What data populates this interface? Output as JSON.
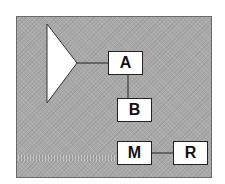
{
  "diagram": {
    "background_color": "#a9a9a9",
    "triangle": {
      "shape": "triangle-pointing-right",
      "fill": "#ffffff"
    },
    "nodes": [
      {
        "id": "A",
        "label": "A"
      },
      {
        "id": "B",
        "label": "B"
      },
      {
        "id": "M",
        "label": "M"
      },
      {
        "id": "R",
        "label": "R"
      }
    ],
    "edges": [
      {
        "from": "triangle",
        "to": "A"
      },
      {
        "from": "A",
        "to": "B"
      },
      {
        "from": "M",
        "to": "R"
      }
    ]
  }
}
